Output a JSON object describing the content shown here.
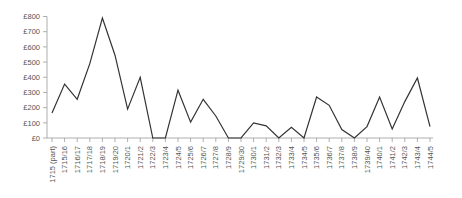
{
  "chart_data": {
    "type": "line",
    "title": "",
    "xlabel": "",
    "ylabel": "",
    "ylim": [
      0,
      800
    ],
    "yticks": [
      0,
      100,
      200,
      300,
      400,
      500,
      600,
      700,
      800
    ],
    "ytick_labels": [
      "£0",
      "£100",
      "£200",
      "£300",
      "£400",
      "£500",
      "£600",
      "£700",
      "£800"
    ],
    "grid": false,
    "legend": null,
    "categories": [
      "1715 (part)",
      "1715/16",
      "1716/17",
      "1717/18",
      "1718/19",
      "1719/20",
      "1720/1",
      "1721/2",
      "1722/3",
      "1723/4",
      "1724/5",
      "1725/6",
      "1726/7",
      "1727/8",
      "1728/9",
      "1729/30",
      "1730/1",
      "1731/2",
      "1732/3",
      "1733/4",
      "1734/5",
      "1735/6",
      "1736/7",
      "1737/8",
      "1738/9",
      "1739/40",
      "1740/1",
      "1741/2",
      "1742/3",
      "1743/4",
      "1744/5"
    ],
    "series": [
      {
        "name": "Value (£)",
        "color": "#333333",
        "values": [
          165,
          355,
          255,
          490,
          790,
          545,
          190,
          400,
          0,
          0,
          315,
          105,
          255,
          145,
          0,
          0,
          100,
          80,
          0,
          70,
          0,
          270,
          215,
          55,
          0,
          75,
          270,
          60,
          240,
          395,
          75
        ]
      }
    ]
  }
}
